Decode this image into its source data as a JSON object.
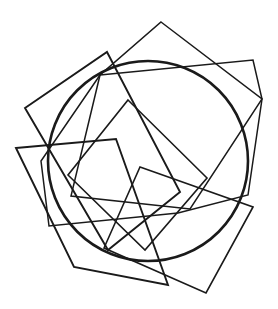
{
  "figure": {
    "background_color": "#ffffff",
    "stroke_color": "#1a1a1a",
    "canvas": {
      "width": 278,
      "height": 309
    }
  },
  "chart_data": {
    "type": "scatter",
    "xlabel": "",
    "ylabel": "",
    "grid": false,
    "legend": false,
    "xlim": [
      0,
      278
    ],
    "ylim": [
      0,
      309
    ],
    "circle": {
      "name": "circle",
      "cx": 148,
      "cy": 161,
      "r": 100,
      "stroke_width": 2.6,
      "stroke_color": "#1a1a1a"
    },
    "squares": [
      {
        "name": "square-1",
        "rotation_deg": 8,
        "stroke_width": 1.5,
        "points": "100,75 253,60 262,99 248,195 178,213 49,226 41,161"
      },
      {
        "name": "square-2",
        "rotation_deg": 36,
        "stroke_width": 1.5,
        "points": "161,22 262,99 190,209 71,196 100,75"
      },
      {
        "name": "square-3",
        "rotation_deg": 58,
        "stroke_width": 1.9,
        "points": "107,52 180,192 108,250 25,108"
      },
      {
        "name": "square-4",
        "rotation_deg": 76,
        "stroke_width": 1.9,
        "points": "16,148 116,139 168,285 74,267"
      },
      {
        "name": "square-5",
        "rotation_deg": 45,
        "stroke_width": 1.6,
        "points": "128,100 207,178 145,250 68,175"
      },
      {
        "name": "square-6",
        "rotation_deg": 22,
        "stroke_width": 1.6,
        "points": "253,207 206,293 104,248 140,167"
      }
    ],
    "series": [
      {
        "name": "circle-center",
        "x": [
          148
        ],
        "y": [
          161
        ]
      }
    ]
  }
}
